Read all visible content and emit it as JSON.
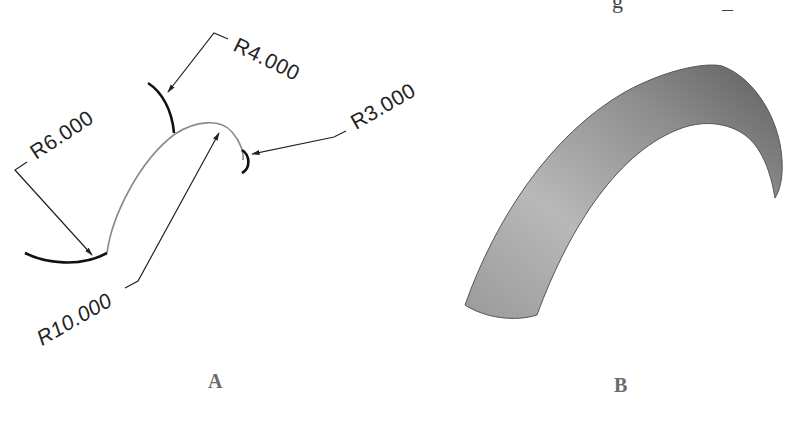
{
  "figure": {
    "top_caption_fragments": [
      "g",
      "_"
    ],
    "panels": [
      {
        "id": "A",
        "label": "A",
        "description": "Wireframe sweep: path arc with three cross-section radii",
        "dimensions": [
          {
            "name": "r4",
            "text": "R4.000"
          },
          {
            "name": "r3",
            "text": "R3.000"
          },
          {
            "name": "r6",
            "text": "R6.000"
          },
          {
            "name": "r10",
            "text": "R10.000"
          }
        ]
      },
      {
        "id": "B",
        "label": "B",
        "description": "Resulting shaded swept surface"
      }
    ],
    "colors": {
      "line_heavy": "#111111",
      "line_path": "#8a8a8a",
      "leader": "#222222",
      "surface_light": "#c4c4c4",
      "surface_dark": "#6a6a6a",
      "label": "#6b6b6b"
    }
  }
}
